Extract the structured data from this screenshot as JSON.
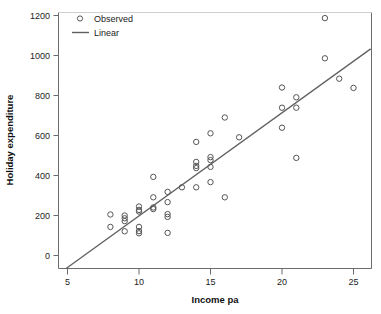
{
  "chart_data": {
    "type": "scatter",
    "title": "",
    "xlabel": "Income pa",
    "ylabel": "Holiday expenditure",
    "xlim": [
      4.3,
      26.2
    ],
    "ylim": [
      -90,
      1265
    ],
    "xticks": [
      5,
      10,
      15,
      20,
      25
    ],
    "yticks": [
      0,
      200,
      400,
      600,
      800,
      1000,
      1200
    ],
    "xtick_labels": [
      "5",
      "10",
      "15",
      "20",
      "25"
    ],
    "ytick_labels": [
      "0",
      "200",
      "400",
      "600",
      "800",
      "1000",
      "1200"
    ],
    "grid": false,
    "legend_position": "top-left",
    "legend": [
      {
        "label": "Observed",
        "marker": "open-circle",
        "color": "#555555"
      },
      {
        "label": "Linear",
        "marker": "line",
        "color": "#606060"
      }
    ],
    "series": [
      {
        "name": "Observed",
        "marker": "open-circle",
        "color": "#555555",
        "points": [
          [
            8,
            205
          ],
          [
            8,
            143
          ],
          [
            9,
            200
          ],
          [
            9,
            186
          ],
          [
            9,
            172
          ],
          [
            9,
            121
          ],
          [
            10,
            245
          ],
          [
            10,
            228
          ],
          [
            10,
            220
          ],
          [
            10,
            143
          ],
          [
            10,
            122
          ],
          [
            10,
            111
          ],
          [
            11,
            393
          ],
          [
            11,
            291
          ],
          [
            11,
            240
          ],
          [
            11,
            232
          ],
          [
            12,
            318
          ],
          [
            12,
            267
          ],
          [
            12,
            207
          ],
          [
            12,
            193
          ],
          [
            12,
            113
          ],
          [
            13,
            341
          ],
          [
            14,
            568
          ],
          [
            14,
            468
          ],
          [
            14,
            448
          ],
          [
            14,
            437
          ],
          [
            14,
            341
          ],
          [
            15,
            611
          ],
          [
            15,
            492
          ],
          [
            15,
            477
          ],
          [
            15,
            443
          ],
          [
            15,
            367
          ],
          [
            16,
            690
          ],
          [
            16,
            291
          ],
          [
            17,
            591
          ],
          [
            20,
            840
          ],
          [
            20,
            739
          ],
          [
            20,
            639
          ],
          [
            21,
            791
          ],
          [
            21,
            739
          ],
          [
            21,
            488
          ],
          [
            23,
            1187
          ],
          [
            23,
            986
          ],
          [
            24,
            884
          ],
          [
            25,
            838
          ]
        ]
      },
      {
        "name": "Linear",
        "type": "line",
        "color": "#606060",
        "line_points": [
          [
            4.9,
            -65
          ],
          [
            26.2,
            1033
          ]
        ],
        "slope": 51.5,
        "intercept": -317
      }
    ]
  }
}
